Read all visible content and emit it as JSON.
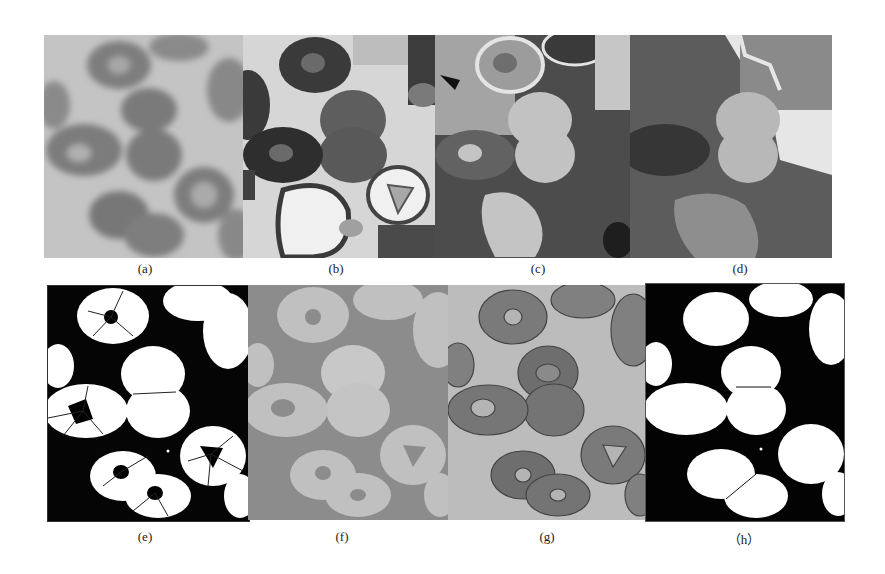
{
  "figure": {
    "panels": [
      {
        "id": "a",
        "label": "(a)",
        "description": "original grayscale blood smear image"
      },
      {
        "id": "b",
        "label": "(b)",
        "description": "multi-level segmentation result"
      },
      {
        "id": "c",
        "label": "(c)",
        "description": "multi-level segmentation result"
      },
      {
        "id": "d",
        "label": "(d)",
        "description": "multi-level segmentation result"
      },
      {
        "id": "e",
        "label": "(e)",
        "description": "binary segmentation with watershed lines"
      },
      {
        "id": "f",
        "label": "(f)",
        "description": "two-level segmentation result"
      },
      {
        "id": "g",
        "label": "(g)",
        "description": "original image with contours"
      },
      {
        "id": "h",
        "label": "（h）",
        "description": "final binary segmentation of cells"
      }
    ]
  }
}
